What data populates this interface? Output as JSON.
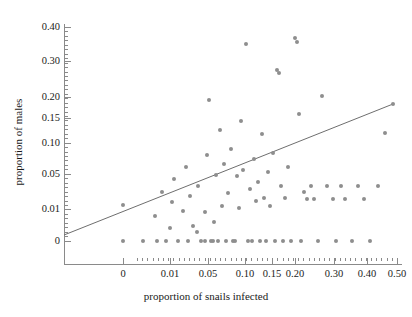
{
  "chart_data": {
    "type": "scatter",
    "title": "",
    "xlabel": "proportion of snails infected",
    "ylabel": "proportion of males",
    "xtick_labels": [
      "0",
      "0.01",
      "0.05",
      "0.10",
      "0.15",
      "0.20",
      "0.30",
      "0.40",
      "0.50"
    ],
    "xtick_values": [
      0,
      0.01,
      0.05,
      0.1,
      0.15,
      0.2,
      0.3,
      0.4,
      0.5
    ],
    "xtick_px": [
      123,
      170,
      208,
      245,
      272,
      295,
      334,
      367,
      397
    ],
    "ytick_labels": [
      "0.40",
      "0.30",
      "0.20",
      "0.15",
      "0.10",
      "0.05",
      "0.01",
      "0"
    ],
    "ytick_values": [
      0.4,
      0.3,
      0.2,
      0.15,
      0.1,
      0.05,
      0.01,
      0
    ],
    "ytick_px": [
      27,
      61,
      97,
      118,
      143,
      174,
      209,
      241
    ],
    "grid": false,
    "legend": null,
    "marker_color": "#8e8e8e",
    "axis_color": "#8a8a8a",
    "line_color": "#6e6e6e",
    "xlim_px": [
      64,
      402
    ],
    "ylim_px": [
      24,
      264
    ],
    "regression_line": {
      "x1_px": 64,
      "y1_px": 235,
      "x2_px": 393,
      "y2_px": 104,
      "label": "fitted regression line"
    },
    "points_px": [
      [
        123,
        205
      ],
      [
        123,
        241
      ],
      [
        143,
        241
      ],
      [
        157,
        241
      ],
      [
        155,
        216
      ],
      [
        162,
        192
      ],
      [
        166,
        241
      ],
      [
        170,
        228
      ],
      [
        172,
        202
      ],
      [
        174,
        179
      ],
      [
        178,
        241
      ],
      [
        183,
        211
      ],
      [
        186,
        167
      ],
      [
        188,
        241
      ],
      [
        190,
        196
      ],
      [
        193,
        226
      ],
      [
        197,
        232
      ],
      [
        198,
        186
      ],
      [
        201,
        241
      ],
      [
        205,
        212
      ],
      [
        205,
        241
      ],
      [
        207,
        155
      ],
      [
        209,
        100
      ],
      [
        211,
        241
      ],
      [
        213,
        241
      ],
      [
        214,
        222
      ],
      [
        216,
        175
      ],
      [
        218,
        241
      ],
      [
        220,
        130
      ],
      [
        222,
        206
      ],
      [
        224,
        164
      ],
      [
        226,
        241
      ],
      [
        228,
        193
      ],
      [
        231,
        149
      ],
      [
        233,
        241
      ],
      [
        235,
        241
      ],
      [
        237,
        176
      ],
      [
        239,
        208
      ],
      [
        241,
        121
      ],
      [
        243,
        170
      ],
      [
        246,
        44
      ],
      [
        248,
        241
      ],
      [
        250,
        189
      ],
      [
        252,
        241
      ],
      [
        254,
        159
      ],
      [
        256,
        201
      ],
      [
        258,
        182
      ],
      [
        260,
        241
      ],
      [
        262,
        134
      ],
      [
        264,
        198
      ],
      [
        266,
        241
      ],
      [
        268,
        172
      ],
      [
        270,
        206
      ],
      [
        273,
        153
      ],
      [
        275,
        241
      ],
      [
        277,
        70
      ],
      [
        279,
        73
      ],
      [
        281,
        186
      ],
      [
        283,
        241
      ],
      [
        285,
        198
      ],
      [
        288,
        167
      ],
      [
        291,
        241
      ],
      [
        295,
        38
      ],
      [
        297,
        42
      ],
      [
        299,
        114
      ],
      [
        301,
        241
      ],
      [
        304,
        192
      ],
      [
        307,
        199
      ],
      [
        311,
        186
      ],
      [
        314,
        199
      ],
      [
        318,
        241
      ],
      [
        322,
        96
      ],
      [
        327,
        186
      ],
      [
        333,
        199
      ],
      [
        336,
        241
      ],
      [
        341,
        186
      ],
      [
        345,
        199
      ],
      [
        352,
        241
      ],
      [
        358,
        186
      ],
      [
        364,
        199
      ],
      [
        370,
        241
      ],
      [
        378,
        186
      ],
      [
        385,
        133
      ],
      [
        393,
        104
      ]
    ]
  }
}
